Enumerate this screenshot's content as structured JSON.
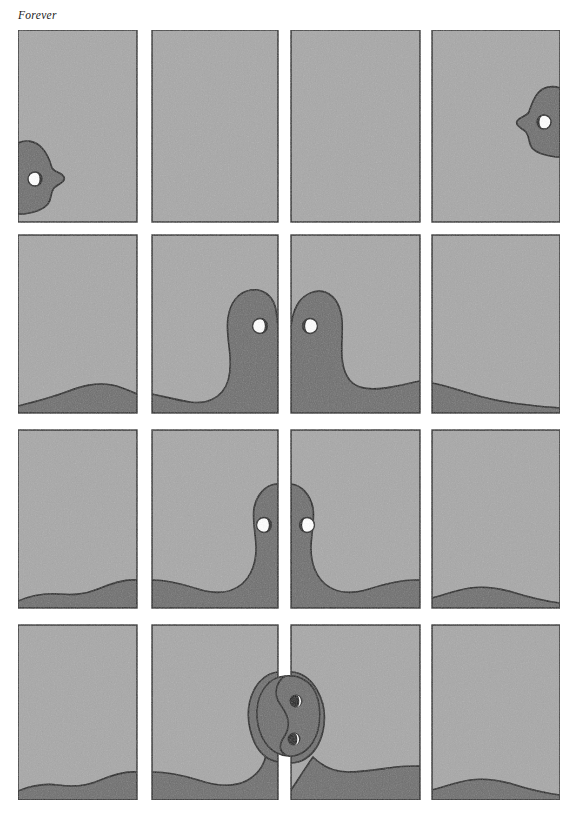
{
  "page": {
    "title": "Forever",
    "medium": "comic-strip",
    "width": 577,
    "height": 820,
    "background_color": "#ffffff"
  },
  "colors": {
    "page_background": "#ffffff",
    "panel_fill": "#a8a8a8",
    "figure_fill": "#6e6e6e",
    "outline": "#1c1c1c",
    "eye_white": "#ffffff",
    "eye_pupil": "#141414",
    "title_text": "#1a1a1a"
  },
  "layout": {
    "columns": 4,
    "rows": 4,
    "column_x": [
      18,
      152,
      291,
      432
    ],
    "column_width": [
      119,
      126,
      129,
      128
    ],
    "row_y": [
      30,
      235,
      430,
      625
    ],
    "row_height": [
      192,
      178,
      178,
      175
    ]
  },
  "rows": [
    {
      "index": 1,
      "label": "row-1-apart",
      "caption": "Forever",
      "description": "Two profile faces at the far outer edges of the strip, looking toward one another across three empty panels.",
      "panels": [
        {
          "index": 1,
          "label": "panel-1-1",
          "content": "left profile face at left edge, facing right",
          "figure": "face-left"
        },
        {
          "index": 2,
          "label": "panel-1-2",
          "content": "empty",
          "figure": "none"
        },
        {
          "index": 3,
          "label": "panel-1-3",
          "content": "empty",
          "figure": "none"
        },
        {
          "index": 4,
          "label": "panel-1-4",
          "content": "right profile face at right edge, facing left",
          "figure": "face-right"
        }
      ]
    },
    {
      "index": 2,
      "label": "row-2-meeting",
      "description": "The two figures have stretched across the strip as long low bodies and meet nose to nose at the centre gutter.",
      "panels": [
        {
          "index": 1,
          "label": "panel-2-1",
          "content": "low body wave entering from the left",
          "figure": "body-left-tail"
        },
        {
          "index": 2,
          "label": "panel-2-2",
          "content": "left figure rises into a head leaning right",
          "figure": "head-left"
        },
        {
          "index": 3,
          "label": "panel-2-3",
          "content": "right figure rises into a head leaning left",
          "figure": "head-right"
        },
        {
          "index": 4,
          "label": "panel-2-4",
          "content": "low body wave exiting to the right",
          "figure": "body-right-tail"
        }
      ]
    },
    {
      "index": 3,
      "label": "row-3-pressing",
      "description": "The two heads have drawn closer and press together, narrower and taller than before.",
      "panels": [
        {
          "index": 1,
          "label": "panel-3-1",
          "content": "low body wave entering from the left",
          "figure": "body-left-tail"
        },
        {
          "index": 2,
          "label": "panel-3-2",
          "content": "left head pressed against centre",
          "figure": "head-left-close"
        },
        {
          "index": 3,
          "label": "panel-3-3",
          "content": "right head pressed against centre",
          "figure": "head-right-close"
        },
        {
          "index": 4,
          "label": "panel-3-4",
          "content": "low body wave exiting to the right",
          "figure": "body-right-tail"
        }
      ]
    },
    {
      "index": 4,
      "label": "row-4-united",
      "description": "The two heads have merged into a single vertical yin-yang form straddling the centre gutter, one eye in each half.",
      "panels": [
        {
          "index": 1,
          "label": "panel-4-1",
          "content": "low body wave entering from the left",
          "figure": "body-left-tail"
        },
        {
          "index": 2,
          "label": "panel-4-2",
          "content": "left body rising to the yin-yang",
          "figure": "body-into-yinyang-left"
        },
        {
          "index": 3,
          "label": "panel-4-3",
          "content": "yin-yang merge and body falling away right",
          "figure": "yinyang"
        },
        {
          "index": 4,
          "label": "panel-4-4",
          "content": "low body wave exiting to the right",
          "figure": "body-right-tail"
        }
      ]
    }
  ],
  "figures": [
    {
      "name": "figure-left",
      "eyes": 1,
      "eye_pupil_side": "right",
      "description": "left character, profile facing right"
    },
    {
      "name": "figure-right",
      "eyes": 1,
      "eye_pupil_side": "left",
      "description": "right character, profile facing left"
    },
    {
      "name": "figure-merged",
      "eyes": 2,
      "eye_pupil_side": "both",
      "description": "both characters merged into a yin-yang"
    }
  ]
}
